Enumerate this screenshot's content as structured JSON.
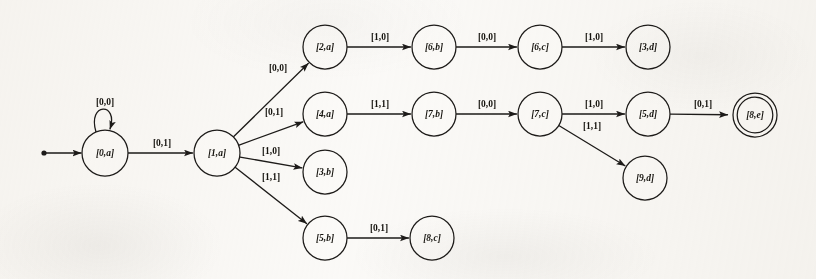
{
  "diagram": {
    "type": "finite-state-transducer",
    "title": "",
    "canvas": {
      "width": 816,
      "height": 279
    },
    "background_color": "#fbfaf8",
    "ink_color": "#1d1b19",
    "start_marker": {
      "label": "",
      "x": 44,
      "y": 153
    },
    "nodes": [
      {
        "id": "0a",
        "label": "[0,a]",
        "x": 105,
        "y": 153,
        "r": 23,
        "accepting": false,
        "start": true
      },
      {
        "id": "1a",
        "label": "[1,a]",
        "x": 217,
        "y": 153,
        "r": 23,
        "accepting": false,
        "start": false
      },
      {
        "id": "2a",
        "label": "[2,a]",
        "x": 325,
        "y": 47,
        "r": 22,
        "accepting": false,
        "start": false
      },
      {
        "id": "4a",
        "label": "[4,a]",
        "x": 325,
        "y": 114,
        "r": 22,
        "accepting": false,
        "start": false
      },
      {
        "id": "3b",
        "label": "[3,b]",
        "x": 325,
        "y": 172,
        "r": 22,
        "accepting": false,
        "start": false
      },
      {
        "id": "5b",
        "label": "[5,b]",
        "x": 325,
        "y": 238,
        "r": 22,
        "accepting": false,
        "start": false
      },
      {
        "id": "6b",
        "label": "[6,b]",
        "x": 434,
        "y": 47,
        "r": 22,
        "accepting": false,
        "start": false
      },
      {
        "id": "7b",
        "label": "[7,b]",
        "x": 434,
        "y": 114,
        "r": 22,
        "accepting": false,
        "start": false
      },
      {
        "id": "8c",
        "label": "[8,c]",
        "x": 432,
        "y": 238,
        "r": 22,
        "accepting": false,
        "start": false
      },
      {
        "id": "6c",
        "label": "[6,c]",
        "x": 540,
        "y": 47,
        "r": 22,
        "accepting": false,
        "start": false
      },
      {
        "id": "7c",
        "label": "[7,c]",
        "x": 540,
        "y": 114,
        "r": 22,
        "accepting": false,
        "start": false
      },
      {
        "id": "3d",
        "label": "[3,d]",
        "x": 648,
        "y": 47,
        "r": 22,
        "accepting": false,
        "start": false
      },
      {
        "id": "5d",
        "label": "[5,d]",
        "x": 648,
        "y": 114,
        "r": 22,
        "accepting": false,
        "start": false
      },
      {
        "id": "9d",
        "label": "[9,d]",
        "x": 645,
        "y": 178,
        "r": 22,
        "accepting": false,
        "start": false
      },
      {
        "id": "8e",
        "label": "[8,e]",
        "x": 755,
        "y": 115,
        "r": 22,
        "accepting": true,
        "start": false
      }
    ],
    "edges": [
      {
        "id": "e-start",
        "from": "start",
        "to": "0a",
        "label": "",
        "kind": "start-arrow"
      },
      {
        "id": "e-0a-0a",
        "from": "0a",
        "to": "0a",
        "label": "[0,0]",
        "kind": "self-loop",
        "label_x": 105,
        "label_y": 103
      },
      {
        "id": "e-0a-1a",
        "from": "0a",
        "to": "1a",
        "label": "[0,1]",
        "kind": "straight",
        "label_x": 162,
        "label_y": 144
      },
      {
        "id": "e-1a-2a",
        "from": "1a",
        "to": "2a",
        "label": "[0,0]",
        "kind": "straight",
        "label_x": 278,
        "label_y": 69
      },
      {
        "id": "e-1a-4a",
        "from": "1a",
        "to": "4a",
        "label": "[0,1]",
        "kind": "straight",
        "label_x": 274,
        "label_y": 113
      },
      {
        "id": "e-1a-3b",
        "from": "1a",
        "to": "3b",
        "label": "[1,0]",
        "kind": "straight",
        "label_x": 271,
        "label_y": 152
      },
      {
        "id": "e-1a-5b",
        "from": "1a",
        "to": "5b",
        "label": "[1,1]",
        "kind": "straight",
        "label_x": 271,
        "label_y": 178
      },
      {
        "id": "e-2a-6b",
        "from": "2a",
        "to": "6b",
        "label": "[1,0]",
        "kind": "straight",
        "label_x": 380,
        "label_y": 38
      },
      {
        "id": "e-6b-6c",
        "from": "6b",
        "to": "6c",
        "label": "[0,0]",
        "kind": "straight",
        "label_x": 487,
        "label_y": 38
      },
      {
        "id": "e-6c-3d",
        "from": "6c",
        "to": "3d",
        "label": "[1,0]",
        "kind": "straight",
        "label_x": 594,
        "label_y": 38
      },
      {
        "id": "e-4a-7b",
        "from": "4a",
        "to": "7b",
        "label": "[1,1]",
        "kind": "straight",
        "label_x": 380,
        "label_y": 105
      },
      {
        "id": "e-7b-7c",
        "from": "7b",
        "to": "7c",
        "label": "[0,0]",
        "kind": "straight",
        "label_x": 487,
        "label_y": 105
      },
      {
        "id": "e-7c-5d",
        "from": "7c",
        "to": "5d",
        "label": "[1,0]",
        "kind": "straight",
        "label_x": 594,
        "label_y": 105
      },
      {
        "id": "e-7c-9d",
        "from": "7c",
        "to": "9d",
        "label": "[1,1]",
        "kind": "straight",
        "label_x": 592,
        "label_y": 127
      },
      {
        "id": "e-5d-8e",
        "from": "5d",
        "to": "8e",
        "label": "[0,1]",
        "kind": "straight",
        "label_x": 703,
        "label_y": 105
      },
      {
        "id": "e-5b-8c",
        "from": "5b",
        "to": "8c",
        "label": "[0,1]",
        "kind": "straight",
        "label_x": 379,
        "label_y": 229
      }
    ]
  }
}
